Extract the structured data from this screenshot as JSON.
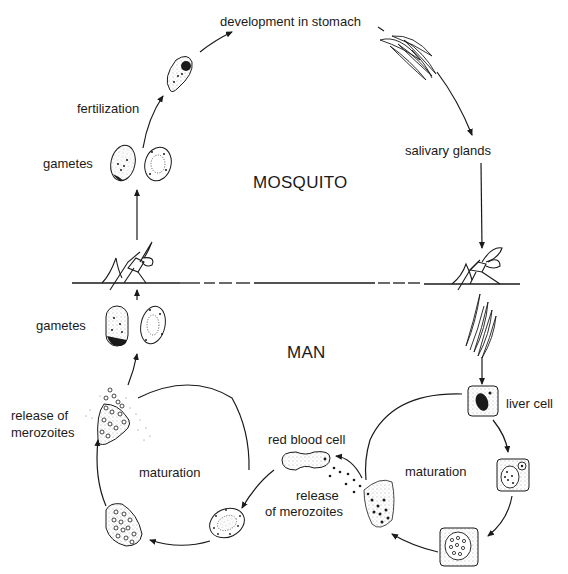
{
  "regions": {
    "upper": "MOSQUITO",
    "lower": "MAN"
  },
  "labels": {
    "development": "development in stomach",
    "fertilization": "fertilization",
    "gametes_mosquito": "gametes",
    "salivary": "salivary glands",
    "gametes_man": "gametes",
    "release_left_1": "release of",
    "release_left_2": "merozoites",
    "maturation_left": "maturation",
    "red_blood_cell": "red blood cell",
    "release_mid_1": "release",
    "release_mid_2": "of merozoites",
    "liver_cell": "liver cell",
    "maturation_right": "maturation"
  },
  "colors": {
    "ink": "#1a1a1a",
    "background": "#ffffff"
  }
}
